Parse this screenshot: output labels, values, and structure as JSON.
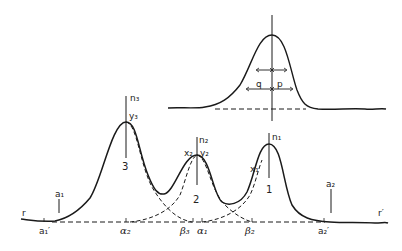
{
  "diagram": {
    "type": "chromatogram-peak-resolution",
    "colors": {
      "ink": "#1a1a1a",
      "background": "#ffffff"
    },
    "inset": {
      "description": "single peak with half-width measurement arrows",
      "labels": {
        "left_half": "q",
        "right_half": "p"
      }
    },
    "main": {
      "baseline_ends": {
        "left": "r",
        "right": "r′"
      },
      "peaks": [
        {
          "number": "1",
          "axis_label": "n₁",
          "point_label": "x₁"
        },
        {
          "number": "2",
          "axis_label": "n₂",
          "point_labels": [
            "x₂",
            "y₂"
          ]
        },
        {
          "number": "3",
          "axis_label": "n₃",
          "point_label": "y₃"
        }
      ],
      "markers": {
        "a1": "a₁",
        "a2": "a₂",
        "a1_prime": "a₁′",
        "a2_prime": "a₂′"
      },
      "baseline_ticks": {
        "alpha2": "α₂",
        "beta3": "β₃",
        "alpha1": "α₁",
        "beta2": "β₂"
      }
    }
  }
}
